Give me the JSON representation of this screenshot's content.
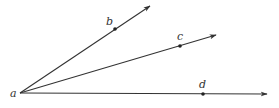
{
  "diagram": {
    "type": "geometry-rays",
    "vertex": {
      "label": "a",
      "x": 20,
      "y": 93,
      "label_x": 10,
      "label_y": 97
    },
    "rays": [
      {
        "name": "ray-ab",
        "through": "b",
        "point_x": 115,
        "point_y": 29,
        "end_x": 150,
        "end_y": 6,
        "label": "b",
        "label_x": 106,
        "label_y": 25
      },
      {
        "name": "ray-ac",
        "through": "c",
        "point_x": 180,
        "point_y": 46,
        "end_x": 216,
        "end_y": 35,
        "label": "c",
        "label_x": 177,
        "label_y": 40
      },
      {
        "name": "ray-ad",
        "through": "d",
        "point_x": 203,
        "point_y": 94,
        "end_x": 267,
        "end_y": 94,
        "label": "d",
        "label_x": 199,
        "label_y": 88
      }
    ],
    "colors": {
      "stroke": "#333333",
      "point": "#222222",
      "background": "#ffffff"
    }
  }
}
